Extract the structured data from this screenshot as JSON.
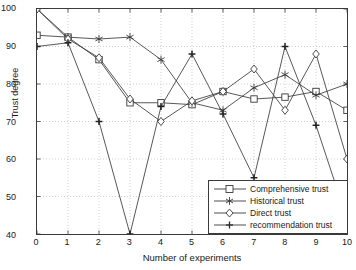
{
  "chart_data": {
    "type": "line",
    "title": "",
    "xlabel": "Number of experiments",
    "ylabel": "Trust degree",
    "xlim": [
      0,
      10
    ],
    "ylim": [
      40,
      100
    ],
    "xticks": [
      "0",
      "1",
      "2",
      "3",
      "4",
      "5",
      "6",
      "7",
      "8",
      "9",
      "10"
    ],
    "yticks": [
      "100",
      "90",
      "80",
      "70",
      "60",
      "50",
      "40"
    ],
    "grid": true,
    "legend_position": "bottom-right",
    "x": [
      0,
      1,
      2,
      3,
      4,
      5,
      6,
      7,
      8,
      9,
      10
    ],
    "series": [
      {
        "name": "Comprehensive trust",
        "marker": "square",
        "values": [
          93,
          92.5,
          86.5,
          75,
          75,
          74.5,
          78,
          76,
          76.5,
          78,
          73
        ]
      },
      {
        "name": "Historical trust",
        "marker": "star",
        "values": [
          100,
          92.5,
          92,
          92.5,
          86.5,
          75,
          73,
          79,
          82.5,
          77,
          80
        ]
      },
      {
        "name": "Direct trust",
        "marker": "diamond",
        "values": [
          100,
          92,
          87,
          76,
          70,
          75.5,
          78,
          84,
          73,
          88,
          60
        ]
      },
      {
        "name": "recommendation trust",
        "marker": "plus",
        "values": [
          90,
          91,
          70,
          40,
          74,
          88,
          72,
          55,
          90,
          69,
          44
        ]
      }
    ]
  }
}
